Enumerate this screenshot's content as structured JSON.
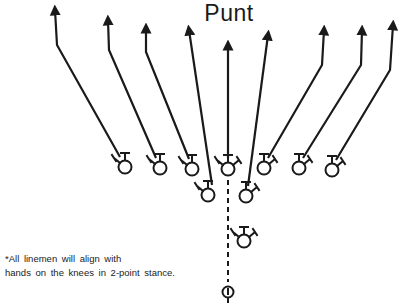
{
  "title": "Punt",
  "note": {
    "line1": "*All linemen will align with",
    "line2": "hands on the knees in 2-point stance."
  },
  "colors": {
    "ink": "#1a1a1a",
    "background": "#ffffff"
  },
  "players": [
    {
      "id": "LE",
      "x": 125,
      "y": 167,
      "stance": "left"
    },
    {
      "id": "LT",
      "x": 160,
      "y": 168,
      "stance": "left"
    },
    {
      "id": "LG",
      "x": 192,
      "y": 169,
      "stance": "left"
    },
    {
      "id": "C",
      "x": 228,
      "y": 169,
      "stance": "center"
    },
    {
      "id": "RG",
      "x": 264,
      "y": 168,
      "stance": "right"
    },
    {
      "id": "RT",
      "x": 299,
      "y": 168,
      "stance": "right"
    },
    {
      "id": "RE",
      "x": 332,
      "y": 170,
      "stance": "right"
    },
    {
      "id": "LW",
      "x": 208,
      "y": 195,
      "stance": "left"
    },
    {
      "id": "RW",
      "x": 246,
      "y": 196,
      "stance": "right"
    },
    {
      "id": "PP",
      "x": 244,
      "y": 241,
      "stance": "center"
    },
    {
      "id": "P",
      "x": 228,
      "y": 292,
      "stance": "punter"
    }
  ],
  "routes": [
    {
      "from": "LE",
      "points": [
        [
          120,
          157
        ],
        [
          57,
          45
        ],
        [
          55,
          10
        ]
      ]
    },
    {
      "from": "LT",
      "points": [
        [
          156,
          158
        ],
        [
          109,
          50
        ],
        [
          108,
          20
        ]
      ]
    },
    {
      "from": "LG",
      "points": [
        [
          189,
          159
        ],
        [
          146,
          52
        ],
        [
          146,
          28
        ]
      ]
    },
    {
      "from": "LW",
      "points": [
        [
          212,
          185
        ],
        [
          189,
          30
        ]
      ]
    },
    {
      "from": "C",
      "points": [
        [
          228,
          158
        ],
        [
          228,
          45
        ]
      ]
    },
    {
      "from": "RW",
      "points": [
        [
          248,
          186
        ],
        [
          268,
          35
        ]
      ]
    },
    {
      "from": "RG",
      "points": [
        [
          268,
          158
        ],
        [
          322,
          65
        ],
        [
          324,
          30
        ]
      ]
    },
    {
      "from": "RT",
      "points": [
        [
          303,
          158
        ],
        [
          361,
          65
        ],
        [
          362,
          30
        ]
      ]
    },
    {
      "from": "RE",
      "points": [
        [
          336,
          160
        ],
        [
          390,
          70
        ],
        [
          393,
          25
        ]
      ]
    }
  ],
  "snap_line": {
    "x": 228,
    "y1": 180,
    "y2": 282
  }
}
